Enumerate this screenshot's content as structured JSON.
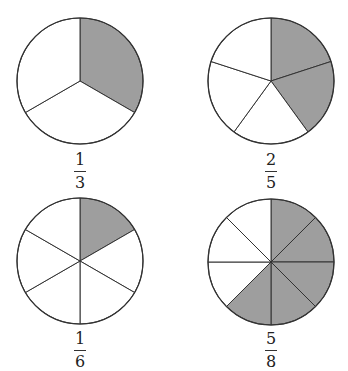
{
  "figure": {
    "colors": {
      "shaded": "#9e9e9e",
      "unshaded": "#ffffff",
      "stroke": "#333333"
    },
    "circles": [
      {
        "id": "one-third",
        "numerator": "1",
        "denominator": "3",
        "parts": 3,
        "shaded": 1,
        "cx": 80,
        "cy": 81,
        "r": 63
      },
      {
        "id": "two-fifths",
        "numerator": "2",
        "denominator": "5",
        "parts": 5,
        "shaded": 2,
        "cx": 271,
        "cy": 81,
        "r": 63
      },
      {
        "id": "one-sixth",
        "numerator": "1",
        "denominator": "6",
        "parts": 6,
        "shaded": 1,
        "cx": 80,
        "cy": 261,
        "r": 63
      },
      {
        "id": "five-eighths",
        "numerator": "5",
        "denominator": "8",
        "parts": 8,
        "shaded": 5,
        "cx": 271,
        "cy": 262,
        "r": 63
      }
    ]
  }
}
